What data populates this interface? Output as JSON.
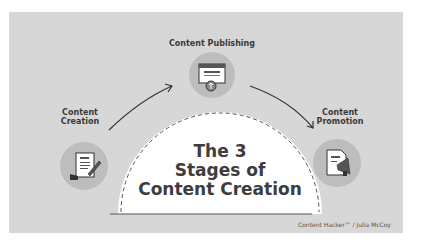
{
  "diagram": {
    "title_lines": [
      "The 3",
      "Stages of",
      "Content Creation"
    ],
    "stages": [
      {
        "label_lines": [
          "Content",
          "Creation"
        ],
        "icon": "document-pen-icon"
      },
      {
        "label_lines": [
          "Content Publishing"
        ],
        "icon": "webpage-upload-icon"
      },
      {
        "label_lines": [
          "Content",
          "Promotion"
        ],
        "icon": "document-megaphone-icon"
      }
    ],
    "credit": "Content Hacker™ / Julia McCoy",
    "colors": {
      "background": "#d7d7d7",
      "circle": "#bdbdbd",
      "dome": "#ffffff",
      "text": "#3a3a3a"
    }
  }
}
